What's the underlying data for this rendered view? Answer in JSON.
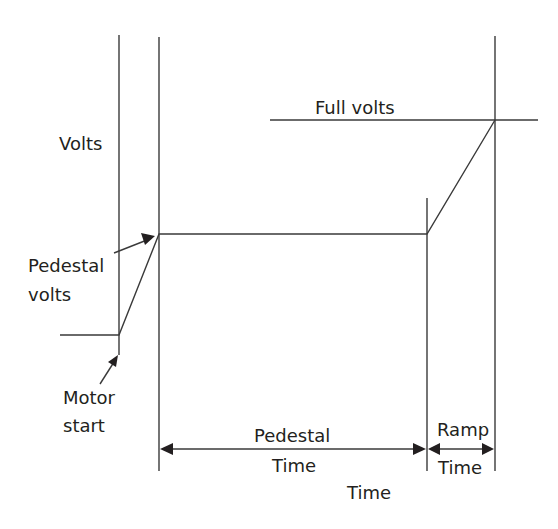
{
  "diagram": {
    "type": "soft-start voltage ramp timing diagram",
    "labels": {
      "y_axis": "Volts",
      "full_volts": "Full volts",
      "pedestal_volts_line1": "Pedestal",
      "pedestal_volts_line2": "volts",
      "motor_start_line1": "Motor",
      "motor_start_line2": "start",
      "pedestal_time_line1": "Pedestal",
      "pedestal_time_line2": "Time",
      "ramp_time_line1": "Ramp",
      "ramp_time_line2": "Time",
      "x_axis": "Time"
    },
    "colors": {
      "line": "#3a3a3a",
      "text": "#231f20",
      "background": "#ffffff"
    }
  }
}
